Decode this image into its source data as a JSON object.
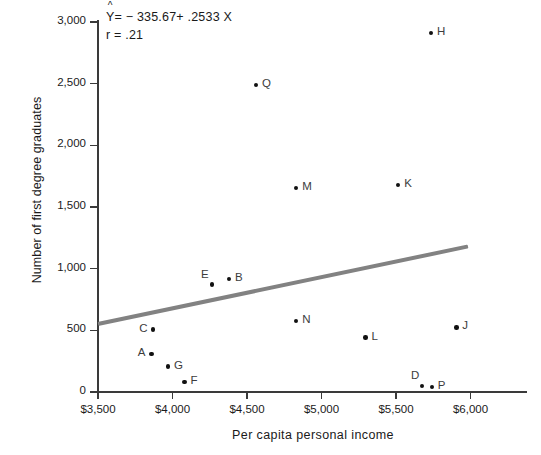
{
  "chart_data": {
    "type": "scatter",
    "title": "",
    "xlabel": "Per capita personal income",
    "ylabel": "Number of first degree graduates",
    "xlim": [
      3500,
      6100
    ],
    "ylim": [
      0,
      3050
    ],
    "grid": false,
    "legend": "none",
    "xticks": [
      {
        "value": 3500,
        "label": "$3,500"
      },
      {
        "value": 4000,
        "label": "$4,000"
      },
      {
        "value": 4500,
        "label": "$4,500"
      },
      {
        "value": 5000,
        "label": "$5,000"
      },
      {
        "value": 5500,
        "label": "$5,500"
      },
      {
        "value": 6000,
        "label": "$6,000"
      }
    ],
    "yticks": [
      {
        "value": 0,
        "label": "0"
      },
      {
        "value": 500,
        "label": "500"
      },
      {
        "value": 1000,
        "label": "1,000"
      },
      {
        "value": 1500,
        "label": "1,500"
      },
      {
        "value": 2000,
        "label": "2,000"
      },
      {
        "value": 2500,
        "label": "2,500"
      },
      {
        "value": 3000,
        "label": "3,000"
      }
    ],
    "points": [
      {
        "label": "H",
        "x": 5735,
        "y": 2910,
        "label_pos": "right"
      },
      {
        "label": "Q",
        "x": 4560,
        "y": 2490,
        "label_pos": "right"
      },
      {
        "label": "K",
        "x": 5515,
        "y": 1680,
        "label_pos": "right"
      },
      {
        "label": "M",
        "x": 4830,
        "y": 1655,
        "label_pos": "right"
      },
      {
        "label": "B",
        "x": 4380,
        "y": 915,
        "label_pos": "right"
      },
      {
        "label": "E",
        "x": 4265,
        "y": 870,
        "label_pos": "above-left"
      },
      {
        "label": "N",
        "x": 4830,
        "y": 575,
        "label_pos": "right"
      },
      {
        "label": "J",
        "x": 5905,
        "y": 525,
        "label_pos": "right"
      },
      {
        "label": "C",
        "x": 3870,
        "y": 505,
        "label_pos": "left"
      },
      {
        "label": "L",
        "x": 5295,
        "y": 440,
        "label_pos": "right"
      },
      {
        "label": "A",
        "x": 3860,
        "y": 310,
        "label_pos": "left"
      },
      {
        "label": "G",
        "x": 3970,
        "y": 205,
        "label_pos": "right"
      },
      {
        "label": "F",
        "x": 4080,
        "y": 80,
        "label_pos": "right"
      },
      {
        "label": "D",
        "x": 5675,
        "y": 50,
        "label_pos": "above-left"
      },
      {
        "label": "P",
        "x": 5740,
        "y": 40,
        "label_pos": "right"
      }
    ],
    "regression": {
      "intercept": -335.67,
      "slope": 0.2533,
      "r": 0.21,
      "color": "#828282",
      "x_start": 3500,
      "x_end": 5980,
      "y_start": 551,
      "y_end": 1179
    },
    "annotations": {
      "equation_symbol": "Y",
      "equation_hat": "^",
      "equation_text": "= − 335.67+ .2533 X",
      "correlation_text": "r = .21"
    }
  }
}
